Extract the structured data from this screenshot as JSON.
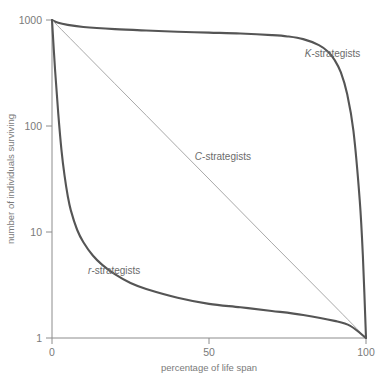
{
  "chart_data": {
    "type": "line",
    "title": "",
    "xlabel": "percentage of life span",
    "ylabel": "number of individuals surviving",
    "xlim": [
      0,
      100
    ],
    "ylim": [
      1,
      1000
    ],
    "yscale": "log",
    "xscale": "linear",
    "grid": false,
    "legend_position": "inline-annotations",
    "xticks": [
      "0",
      "50",
      "100"
    ],
    "xtick_values": [
      0,
      50,
      100
    ],
    "yticks": [
      "1000",
      "100",
      "10",
      "1"
    ],
    "ytick_values": [
      1000,
      100,
      10,
      1
    ],
    "series": [
      {
        "name": "K-strategists",
        "label_prefix": "K",
        "label_suffix": "-strategists",
        "color": "#555555",
        "width": 2.1,
        "x": [
          0,
          2,
          5,
          10,
          20,
          30,
          40,
          50,
          60,
          70,
          75,
          80,
          85,
          88,
          90,
          92,
          94,
          96,
          98,
          99,
          100
        ],
        "y": [
          1000,
          940,
          900,
          860,
          820,
          795,
          775,
          760,
          745,
          720,
          700,
          660,
          580,
          500,
          420,
          320,
          200,
          90,
          20,
          6,
          1
        ]
      },
      {
        "name": "C-strategists",
        "label_prefix": "C",
        "label_suffix": "-strategists",
        "color": "#a9a9a9",
        "width": 1.0,
        "x": [
          0,
          10,
          20,
          30,
          40,
          50,
          60,
          70,
          80,
          90,
          100
        ],
        "y": [
          1000,
          501,
          251,
          126,
          63,
          31.6,
          15.8,
          7.9,
          3.98,
          2.0,
          1
        ]
      },
      {
        "name": "r-strategists",
        "label_prefix": "r",
        "label_suffix": "-strategists",
        "color": "#555555",
        "width": 2.1,
        "x": [
          0,
          1,
          2,
          3,
          4,
          5,
          6,
          8,
          10,
          13,
          16,
          20,
          25,
          30,
          40,
          50,
          60,
          70,
          80,
          90,
          95,
          100
        ],
        "y": [
          1000,
          330,
          130,
          60,
          34,
          22,
          16,
          10.5,
          8.0,
          6.0,
          4.9,
          4.0,
          3.3,
          2.9,
          2.4,
          2.1,
          1.95,
          1.8,
          1.65,
          1.45,
          1.3,
          1
        ]
      }
    ],
    "annotations": [
      {
        "name": "K-strategists",
        "x_pct": 80.5,
        "y_px": 57
      },
      {
        "name": "C-strategists",
        "x_pct": 45.5,
        "y_px": 160
      },
      {
        "name": "r-strategists",
        "x_pct": 11.5,
        "y_px": 274
      }
    ]
  },
  "axes": {
    "x_axis_title": "percentage of life span",
    "y_axis_title": "number of individuals surviving",
    "axis_color": "#8c8c8c"
  }
}
